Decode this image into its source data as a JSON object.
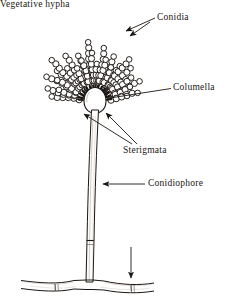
{
  "figure": {
    "background_color": "#ffffff",
    "ink_color": "#1b1613",
    "width": 231,
    "height": 306
  },
  "labels": {
    "conidia": "Conidia",
    "columella": "Columella",
    "sterigmata": "Sterigmata",
    "conidiophore": "Conidiophore",
    "vegetative_hypha": "Vegetative hypha"
  },
  "structures": {
    "vesicle": {
      "name": "columella-vesicle",
      "center_x": 95,
      "center_y": 102,
      "radius": 11
    },
    "conidia_chains": {
      "count": 28,
      "beads_per_chain_min": 4,
      "beads_per_chain_max": 9,
      "bead_radius": 3.1,
      "inner_radius": 16,
      "spread_start_deg": 188,
      "spread_end_deg": 352
    },
    "sterigmata": {
      "count": 28,
      "inner_radius": 12,
      "outer_radius": 17
    },
    "stalk": {
      "top_x": 95,
      "top_y": 113,
      "bottom_x": 89,
      "bottom_y": 282,
      "width_top": 6,
      "width_bottom": 7,
      "septum_y": 242
    },
    "hypha": {
      "baseline_y": 283,
      "left_x": 22,
      "right_x": 152,
      "thickness": 8,
      "septa_x": [
        55,
        132
      ]
    }
  },
  "leaders": {
    "conidia": {
      "from_x": 155,
      "from_y": 18,
      "to_x": 124,
      "to_y": 32,
      "arrow": true
    },
    "columella": {
      "from_x": 171,
      "from_y": 89,
      "to_x": 108,
      "to_y": 99,
      "arrow": false
    },
    "sterigmata_a": {
      "from_x": 131,
      "from_y": 144,
      "to_x": 83,
      "to_y": 113,
      "arrow": true
    },
    "sterigmata_b": {
      "from_x": 136,
      "from_y": 144,
      "to_x": 107,
      "to_y": 113,
      "arrow": true
    },
    "conidiophore": {
      "from_x": 145,
      "from_y": 184,
      "to_x": 104,
      "to_y": 184,
      "arrow": true
    },
    "vegetative": {
      "from_x": 131,
      "from_y": 247,
      "to_x": 131,
      "to_y": 277,
      "arrow": true
    }
  }
}
